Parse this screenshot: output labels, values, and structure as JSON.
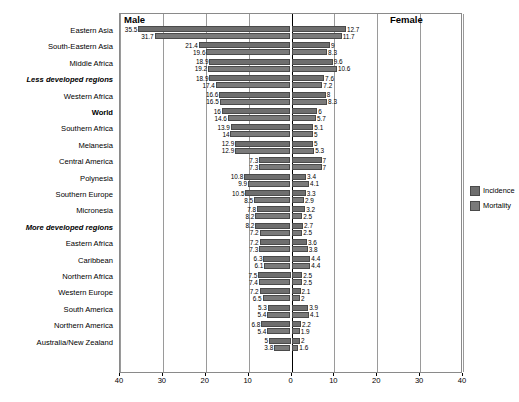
{
  "chart_data": {
    "type": "bar",
    "orientation": "horizontal",
    "style": "back-to-back population pyramid",
    "title": "",
    "xlabel": "",
    "ylabel": "",
    "xlim": [
      -40,
      40
    ],
    "xticks": [
      40,
      30,
      20,
      10,
      0,
      10,
      20,
      30,
      40
    ],
    "grid": true,
    "legend_position": "right",
    "panels": [
      {
        "name": "Male",
        "side": "left"
      },
      {
        "name": "Female",
        "side": "right"
      }
    ],
    "legend": [
      {
        "name": "Incidence",
        "color": "#6e6e6e"
      },
      {
        "name": "Mortality",
        "color": "#7a7a7a"
      }
    ],
    "series": [
      {
        "name": "Incidence",
        "panel": "Male"
      },
      {
        "name": "Mortality",
        "panel": "Male"
      },
      {
        "name": "Incidence",
        "panel": "Female"
      },
      {
        "name": "Mortality",
        "panel": "Female"
      }
    ],
    "categories": [
      "Eastern Asia",
      "South-Eastern Asia",
      "Middle Africa",
      "Less developed regions",
      "Western Africa",
      "World",
      "Southern Africa",
      "Melanesia",
      "Central America",
      "Polynesia",
      "Southern Europe",
      "Micronesia",
      "More developed regions",
      "Eastern Africa",
      "Caribbean",
      "Northern Africa",
      "Western Europe",
      "South America",
      "Northern America",
      "Australia/New Zealand"
    ],
    "emphasis": [
      "Less developed regions",
      "World",
      "More developed regions"
    ],
    "rows": [
      {
        "category": "Eastern Asia",
        "male_incidence": 35.5,
        "male_mortality": 31.7,
        "female_incidence": 12.7,
        "female_mortality": 11.7
      },
      {
        "category": "South-Eastern Asia",
        "male_incidence": 21.4,
        "male_mortality": 19.6,
        "female_incidence": 9.0,
        "female_mortality": 8.3
      },
      {
        "category": "Middle Africa",
        "male_incidence": 18.9,
        "male_mortality": 19.2,
        "female_incidence": 9.6,
        "female_mortality": 10.6
      },
      {
        "category": "Less developed regions",
        "male_incidence": 18.9,
        "male_mortality": 17.4,
        "female_incidence": 7.6,
        "female_mortality": 7.2
      },
      {
        "category": "Western Africa",
        "male_incidence": 16.6,
        "male_mortality": 16.5,
        "female_incidence": 8.0,
        "female_mortality": 8.3
      },
      {
        "category": "World",
        "male_incidence": 16.0,
        "male_mortality": 14.6,
        "female_incidence": 6.0,
        "female_mortality": 5.7
      },
      {
        "category": "Southern Africa",
        "male_incidence": 13.9,
        "male_mortality": 14.0,
        "female_incidence": 5.1,
        "female_mortality": 5.0
      },
      {
        "category": "Melanesia",
        "male_incidence": 12.9,
        "male_mortality": 12.9,
        "female_incidence": 5.0,
        "female_mortality": 5.3
      },
      {
        "category": "Central America",
        "male_incidence": 7.3,
        "male_mortality": 7.3,
        "female_incidence": 7.0,
        "female_mortality": 7.0
      },
      {
        "category": "Polynesia",
        "male_incidence": 10.8,
        "male_mortality": 9.9,
        "female_incidence": 3.4,
        "female_mortality": 4.1
      },
      {
        "category": "Southern Europe",
        "male_incidence": 10.5,
        "male_mortality": 8.5,
        "female_incidence": 3.3,
        "female_mortality": 2.9
      },
      {
        "category": "Micronesia",
        "male_incidence": 7.8,
        "male_mortality": 8.2,
        "female_incidence": 3.2,
        "female_mortality": 2.5
      },
      {
        "category": "More developed regions",
        "male_incidence": 8.2,
        "male_mortality": 7.2,
        "female_incidence": 2.7,
        "female_mortality": 2.5
      },
      {
        "category": "Eastern Africa",
        "male_incidence": 7.2,
        "male_mortality": 7.3,
        "female_incidence": 3.6,
        "female_mortality": 3.8
      },
      {
        "category": "Caribbean",
        "male_incidence": 6.3,
        "male_mortality": 6.1,
        "female_incidence": 4.4,
        "female_mortality": 4.4
      },
      {
        "category": "Northern Africa",
        "male_incidence": 7.5,
        "male_mortality": 7.4,
        "female_incidence": 2.5,
        "female_mortality": 2.5
      },
      {
        "category": "Western Europe",
        "male_incidence": 7.2,
        "male_mortality": 6.5,
        "female_incidence": 2.1,
        "female_mortality": 2.0
      },
      {
        "category": "South America",
        "male_incidence": 5.3,
        "male_mortality": 5.4,
        "female_incidence": 3.9,
        "female_mortality": 4.1
      },
      {
        "category": "Northern America",
        "male_incidence": 6.8,
        "male_mortality": 5.4,
        "female_incidence": 2.2,
        "female_mortality": 1.9
      },
      {
        "category": "Australia/New Zealand",
        "male_incidence": 5.0,
        "male_mortality": 3.8,
        "female_incidence": 2.0,
        "female_mortality": 1.6
      }
    ]
  },
  "colors": {
    "incidence": "#6e6e6e",
    "mortality": "#7a7a7a",
    "axis": "#000000",
    "grid": "#9a9a9a",
    "frame": "#8a8a8a"
  }
}
